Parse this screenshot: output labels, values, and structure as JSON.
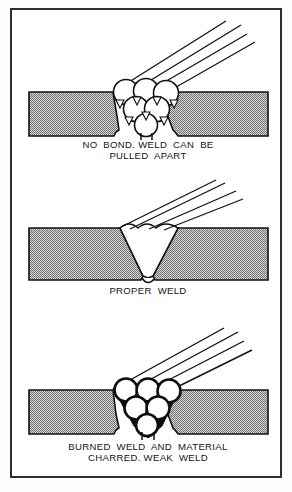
{
  "figure": {
    "border_color": "#2e2e2e",
    "plate_fill": "#a9a9a9",
    "background": "#ffffff",
    "line_color": "#111111"
  },
  "panels": [
    {
      "id": "no-bond",
      "caption_line_1": "NO  BOND. WELD  CAN  BE",
      "caption_line_2": "PULLED  APART",
      "bead_type": "stacked-beads-with-voids",
      "bead_count": 6,
      "void_markers": 7,
      "electrode_lines": 4,
      "plate_gap": true
    },
    {
      "id": "proper-weld",
      "caption_line_1": "PROPER  WELD",
      "caption_line_2": "",
      "bead_type": "fused-v-groove",
      "bead_count": 0,
      "void_markers": 0,
      "electrode_lines": 4,
      "plate_gap": false
    },
    {
      "id": "burned-weld",
      "caption_line_1": "BURNED  WELD  AND  MATERIAL",
      "caption_line_2": "CHARRED. WEAK  WELD",
      "bead_type": "charred-stacked-beads",
      "bead_count": 6,
      "void_markers": 0,
      "electrode_lines": 4,
      "plate_gap": true
    }
  ]
}
